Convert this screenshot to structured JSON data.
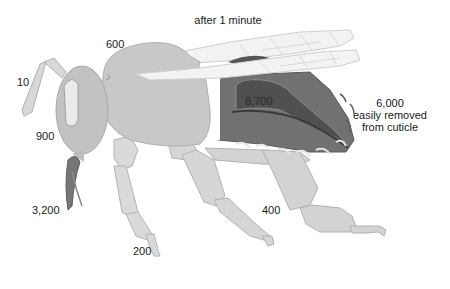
{
  "diagram": {
    "title": "after 1 minute",
    "colors": {
      "body": "#c9c9c9",
      "body_stroke": "#a9a9a9",
      "leg": "#d6d6d6",
      "wing": "#f1f1f1",
      "wing_vein": "#cfcfcf",
      "abdomen": "#6f6f6f",
      "abdomen_dark": "#4f4f4f",
      "eye": "#ececec",
      "tongue": "#7a7a7a"
    },
    "labels": {
      "antenna": "10",
      "thorax": "600",
      "head": "900",
      "mouthparts": "3,200",
      "foreleg": "200",
      "hindleg": "400",
      "abdomen_inner": "8,700",
      "abdomen_outer_value": "6,000",
      "abdomen_outer_line1": "easily removed",
      "abdomen_outer_line2": "from cuticle"
    }
  }
}
